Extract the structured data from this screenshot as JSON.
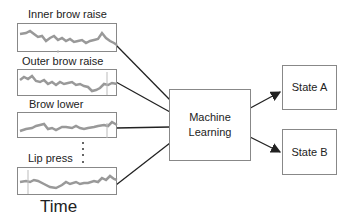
{
  "signals": [
    {
      "label": "Inner brow raise"
    },
    {
      "label": "Outer brow raise"
    },
    {
      "label": "Brow lower"
    },
    {
      "label": "Lip press"
    }
  ],
  "axis_label": "Time",
  "processor": {
    "line1": "Machine",
    "line2": "Learning"
  },
  "outputs": [
    {
      "label": "State A"
    },
    {
      "label": "State B"
    }
  ],
  "colors": {
    "line": "#222222",
    "border": "#888888",
    "signal": "#999999"
  }
}
